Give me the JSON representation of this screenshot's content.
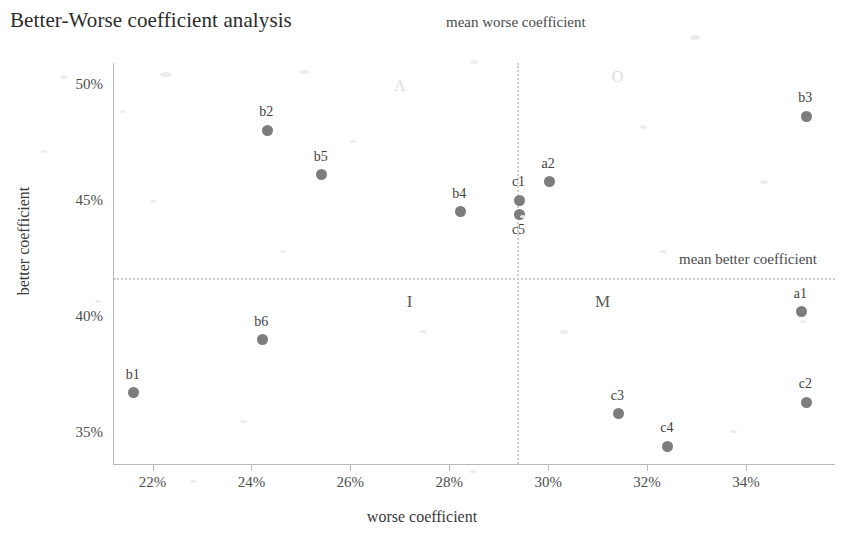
{
  "chart_data": {
    "type": "scatter",
    "title": "Better-Worse coefficient analysis",
    "xlabel": "worse coefficient",
    "ylabel": "better coefficient",
    "xlim": [
      21.2,
      35.8
    ],
    "ylim": [
      33.6,
      50.9
    ],
    "xticks": [
      "22%",
      "24%",
      "26%",
      "28%",
      "30%",
      "32%",
      "34%"
    ],
    "xtick_values": [
      22,
      24,
      26,
      28,
      30,
      32,
      34
    ],
    "yticks": [
      "50%",
      "45%",
      "40%",
      "35%"
    ],
    "ytick_values": [
      50,
      45,
      40,
      35
    ],
    "grid": false,
    "legend": "none",
    "points": [
      {
        "label": "b1",
        "x": 21.6,
        "y": 36.7,
        "label_pos": "above"
      },
      {
        "label": "b2",
        "x": 24.3,
        "y": 48.0,
        "label_pos": "above"
      },
      {
        "label": "b3",
        "x": 35.2,
        "y": 48.6,
        "label_pos": "above"
      },
      {
        "label": "b4",
        "x": 28.2,
        "y": 44.5,
        "label_pos": "above"
      },
      {
        "label": "b5",
        "x": 25.4,
        "y": 46.1,
        "label_pos": "above"
      },
      {
        "label": "b6",
        "x": 24.2,
        "y": 39.0,
        "label_pos": "above"
      },
      {
        "label": "c1",
        "x": 29.4,
        "y": 45.0,
        "label_pos": "above"
      },
      {
        "label": "c5",
        "x": 29.4,
        "y": 44.4,
        "label_pos": "below"
      },
      {
        "label": "c2",
        "x": 35.2,
        "y": 36.3,
        "label_pos": "above"
      },
      {
        "label": "c3",
        "x": 31.4,
        "y": 35.8,
        "label_pos": "above"
      },
      {
        "label": "c4",
        "x": 32.4,
        "y": 34.4,
        "label_pos": "above"
      },
      {
        "label": "a1",
        "x": 35.1,
        "y": 40.2,
        "label_pos": "above"
      },
      {
        "label": "a2",
        "x": 30.0,
        "y": 45.8,
        "label_pos": "above"
      }
    ],
    "reference_lines": [
      {
        "id": "mean-worse",
        "orientation": "vertical",
        "value": 29.35,
        "label": "mean worse coefficient"
      },
      {
        "id": "mean-better",
        "orientation": "horizontal",
        "value": 41.65,
        "label": "mean better coefficient"
      }
    ],
    "quadrant_labels": [
      {
        "label": "A",
        "x": 27.0,
        "y": 49.9
      },
      {
        "label": "O",
        "x": 31.4,
        "y": 50.3
      },
      {
        "label": "I",
        "x": 27.2,
        "y": 40.6
      },
      {
        "label": "M",
        "x": 31.1,
        "y": 40.6
      }
    ],
    "colors": {
      "marker": "#7d7d7d",
      "axis": "#b9b9b9",
      "reference_line": "#cfcfcf",
      "text": "#3a3a3a",
      "quadrant_label": "#dcdcdc"
    }
  }
}
